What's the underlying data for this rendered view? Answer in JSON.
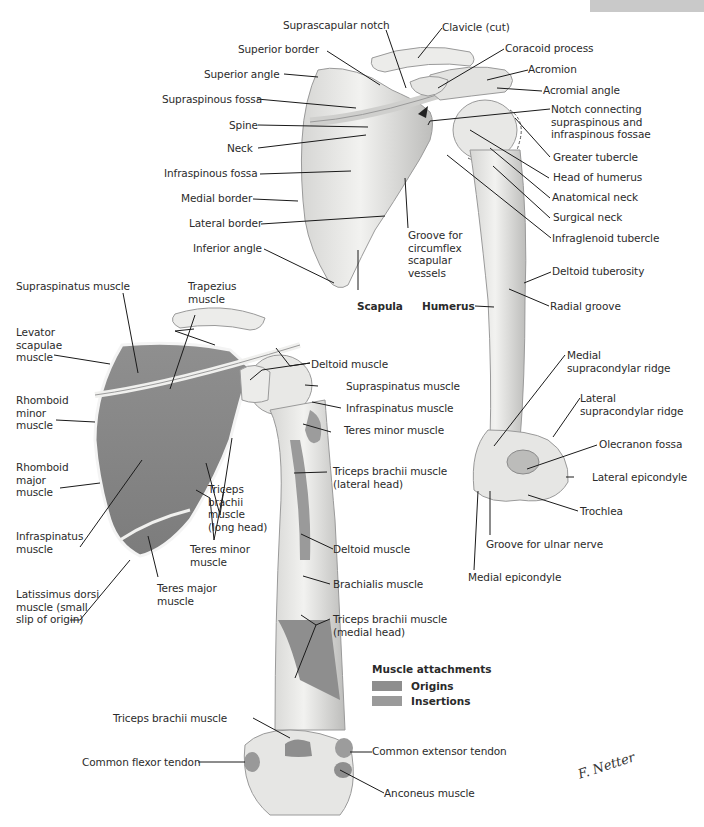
{
  "plate": {
    "tab_label": ""
  },
  "colors": {
    "origin": "#8e8e8e",
    "insertion": "#9a9a9a",
    "bone": "#e8e8e6",
    "bone_shadow": "#bdbdbb",
    "muscle_area": "#8a8a8a",
    "leader": "#1a1a1a"
  },
  "top_figure": {
    "labels": {
      "suprascapular_notch": "Suprascapular notch",
      "clavicle_cut": "Clavicle (cut)",
      "coracoid_process": "Coracoid process",
      "superior_border": "Superior border",
      "acromion": "Acromion",
      "superior_angle": "Superior angle",
      "acromial_angle": "Acromial angle",
      "supraspinous_fossa": "Supraspinous fossa",
      "notch_connecting": "Notch connecting\nsupraspinous and\ninfraspinous fossae",
      "spine": "Spine",
      "neck": "Neck",
      "greater_tubercle": "Greater tubercle",
      "infraspinous_fossa": "Infraspinous fossa",
      "head_of_humerus": "Head of humerus",
      "medial_border": "Medial border",
      "anatomical_neck": "Anatomical neck",
      "lateral_border": "Lateral border",
      "surgical_neck": "Surgical neck",
      "infraglenoid_tubercle": "Infraglenoid tubercle",
      "inferior_angle": "Inferior angle",
      "groove_circumflex": "Groove for\ncircumflex\nscapular\nvessels",
      "deltoid_tuberosity": "Deltoid tuberosity",
      "scapula": "Scapula",
      "humerus": "Humerus",
      "radial_groove": "Radial groove",
      "medial_supracondylar_ridge": "Medial\nsupracondylar ridge",
      "lateral_supracondylar_ridge": "Lateral\nsupracondylar ridge",
      "olecranon_fossa": "Olecranon fossa",
      "lateral_epicondyle": "Lateral epicondyle",
      "trochlea": "Trochlea",
      "groove_ulnar_nerve": "Groove for ulnar nerve",
      "medial_epicondyle": "Medial epicondyle"
    }
  },
  "bottom_figure": {
    "labels": {
      "supraspinatus_muscle_left": "Supraspinatus muscle",
      "trapezius_muscle": "Trapezius\nmuscle",
      "levator_scapulae": "Levator\nscapulae\nmuscle",
      "deltoid_muscle_top": "Deltoid muscle",
      "supraspinatus_muscle_right": "Supraspinatus muscle",
      "rhomboid_minor": "Rhomboid\nminor\nmuscle",
      "infraspinatus_muscle_right": "Infraspinatus muscle",
      "teres_minor_right": "Teres minor muscle",
      "rhomboid_major": "Rhomboid\nmajor\nmuscle",
      "triceps_long_head": "Triceps\nbrachii\nmuscle\n(long head)",
      "triceps_lateral_head": "Triceps brachii muscle\n(lateral head)",
      "infraspinatus_muscle_left": "Infraspinatus\nmuscle",
      "teres_minor_left": "Teres minor\nmuscle",
      "deltoid_muscle_mid": "Deltoid muscle",
      "latissimus_dorsi": "Latissimus dorsi\nmuscle (small\nslip of origin)",
      "teres_major": "Teres major\nmuscle",
      "brachialis_muscle": "Brachialis muscle",
      "triceps_medial_head": "Triceps brachii muscle\n(medial head)",
      "triceps_brachii_muscle": "Triceps brachii muscle",
      "common_extensor_tendon": "Common extensor tendon",
      "common_flexor_tendon": "Common flexor tendon",
      "anconeus_muscle": "Anconeus muscle"
    }
  },
  "legend": {
    "title": "Muscle attachments",
    "items": [
      {
        "label": "Origins",
        "color": "#8e8e8e"
      },
      {
        "label": "Insertions",
        "color": "#9a9a9a"
      }
    ]
  },
  "signature": "F. Netter"
}
